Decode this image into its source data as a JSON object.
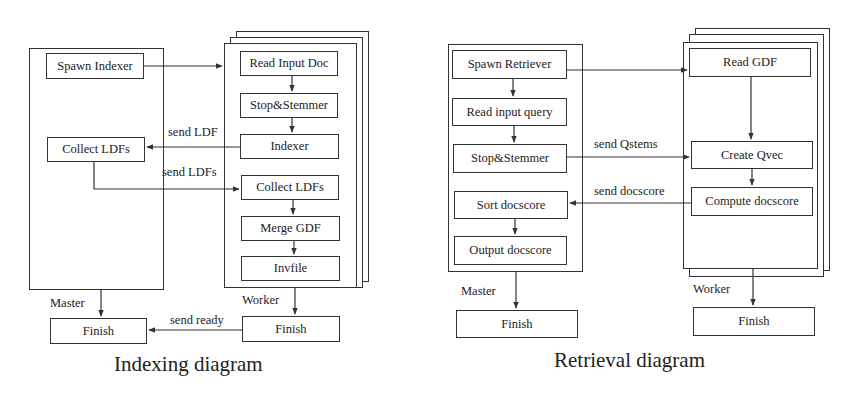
{
  "indexing": {
    "title": "Indexing diagram",
    "master_label": "Master",
    "worker_label": "Worker",
    "master_nodes": {
      "spawn": "Spawn Indexer",
      "collect": "Collect LDFs",
      "finish": "Finish"
    },
    "worker_nodes": {
      "read": "Read Input Doc",
      "stop": "Stop&Stemmer",
      "indexer": "Indexer",
      "collect": "Collect LDFs",
      "merge": "Merge GDF",
      "invfile": "Invfile",
      "finish": "Finish"
    },
    "messages": {
      "send_ldf": "send LDF",
      "send_ldfs": "send LDFs",
      "send_ready": "send ready"
    }
  },
  "retrieval": {
    "title": "Retrieval diagram",
    "master_label": "Master",
    "worker_label": "Worker",
    "master_nodes": {
      "spawn": "Spawn Retriever",
      "read_query": "Read input query",
      "stop": "Stop&Stemmer",
      "sort": "Sort docscore",
      "output": "Output docscore",
      "finish": "Finish"
    },
    "worker_nodes": {
      "read_gdf": "Read GDF",
      "create_qvec": "Create Qvec",
      "compute": "Compute docscore",
      "finish": "Finish"
    },
    "messages": {
      "send_qstems": "send Qstems",
      "send_docscore": "send docscore"
    }
  },
  "colors": {
    "line": "#333333",
    "background": "#ffffff"
  }
}
